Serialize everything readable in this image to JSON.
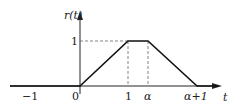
{
  "diagram": {
    "y_label": "r(t)",
    "x_label": "t",
    "ticks": {
      "neg_one": "−1",
      "zero": "0",
      "one": "1",
      "alpha": "α",
      "alpha_plus_one": "α+1"
    },
    "y_tick": "1",
    "shape": "trapezoid",
    "points": [
      [
        -1.5,
        0
      ],
      [
        0,
        0
      ],
      [
        1,
        1
      ],
      [
        "α",
        1
      ],
      [
        "α+1",
        0
      ],
      [
        "beyond",
        0
      ]
    ]
  }
}
